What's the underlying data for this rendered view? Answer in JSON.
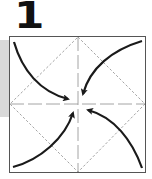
{
  "step": {
    "number": "1"
  },
  "diagram": {
    "type": "origami-step",
    "colors": {
      "paper_border": "#555555",
      "fold_lines": "#9a9a9a",
      "crease_lines": "#9a9a9a",
      "arrows": "#1a1a1a",
      "side_band": "#d9d9d9"
    },
    "arrows": [
      {
        "from": "top-left corner",
        "to": "center"
      },
      {
        "from": "top-right corner",
        "to": "center"
      },
      {
        "from": "bottom-left corner",
        "to": "center"
      },
      {
        "from": "bottom-right corner",
        "to": "center"
      }
    ]
  }
}
